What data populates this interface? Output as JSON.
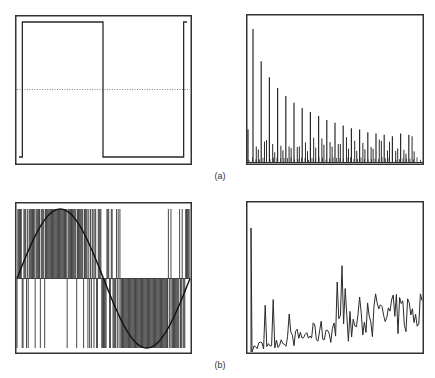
{
  "figure": {
    "captions": {
      "a": "(a)",
      "b": "(b)"
    },
    "ink": "#2a2a2a",
    "frame": "#333333"
  },
  "chart_data": [
    {
      "id": "a-left",
      "type": "line",
      "title": "",
      "description": "One period of a square wave with a dotted zero line",
      "xlabel": "",
      "ylabel": "",
      "x": [
        0,
        0.02,
        0.02,
        0.5,
        0.5,
        0.98,
        0.98,
        1.0
      ],
      "y": [
        -1,
        -1,
        1,
        1,
        -1,
        -1,
        1,
        1
      ],
      "zero_line": true,
      "ylim": [
        -1.1,
        1.1
      ]
    },
    {
      "id": "a-right",
      "type": "bar",
      "title": "",
      "description": "Magnitude spectrum of square wave: dominant odd harmonics decaying with small sidelobe lines in between",
      "major_peaks": [
        1.0,
        0.76,
        0.64,
        0.56,
        0.5,
        0.45,
        0.41,
        0.38,
        0.35,
        0.32,
        0.3,
        0.28,
        0.26,
        0.25,
        0.23,
        0.22,
        0.21,
        0.2,
        0.22,
        0.21
      ],
      "ylim": [
        0,
        1.05
      ]
    },
    {
      "id": "b-left",
      "type": "line",
      "title": "",
      "description": "Sine wave overlaid on a pulse-density (binary) modulated signal; dense stripes above axis near the positive peak, below axis near the negative peak",
      "sine_periods": 1,
      "ylim": [
        -1.1,
        1.1
      ]
    },
    {
      "id": "b-right",
      "type": "line",
      "title": "",
      "description": "Noisy spectrum of the pulse-density signal: single strong low-frequency peak followed by noise floor rising with frequency",
      "first_peak": 0.88,
      "ylim": [
        0,
        1.0
      ]
    }
  ]
}
